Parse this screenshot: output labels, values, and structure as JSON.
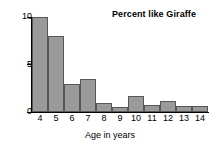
{
  "chart_data": {
    "type": "bar",
    "title": "Percent like Giraffe",
    "xlabel": "Age in years",
    "ylabel": "",
    "categories": [
      "4",
      "5",
      "6",
      "7",
      "8",
      "9",
      "10",
      "11",
      "12",
      "13",
      "14"
    ],
    "values": [
      10,
      8,
      3,
      3.5,
      1,
      0.5,
      1.7,
      0.7,
      1.2,
      0.6,
      0.6
    ],
    "xlim": [
      4,
      15
    ],
    "ylim": [
      0,
      10
    ],
    "yticks": [
      "0",
      "5",
      "10"
    ],
    "ytick_values": [
      0,
      5,
      10
    ],
    "xticks": [
      "4",
      "5",
      "6",
      "7",
      "8",
      "9",
      "10",
      "11",
      "12",
      "13",
      "14"
    ],
    "grid": false,
    "legend": null,
    "bar_color": "#9a9a9a",
    "bar_edge_color": "#565656",
    "axis_color": "#000000",
    "background": "#ffffff"
  }
}
